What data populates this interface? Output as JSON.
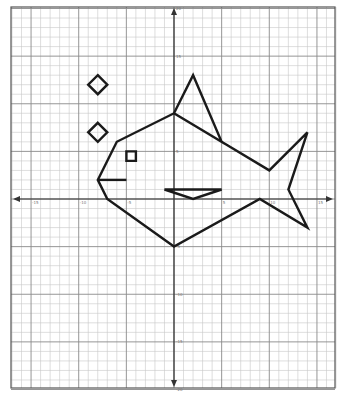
{
  "figure": {
    "type": "coordinate-grid-drawing",
    "colors": {
      "background": "#ffffff",
      "grid_minor": "#c8c8c8",
      "grid_major": "#8a8a8a",
      "axis": "#333333",
      "shape_stroke": "#1a1a1a",
      "border": "#555555"
    }
  },
  "grid": {
    "x_range": [
      -17,
      17
    ],
    "y_range": [
      -20,
      20
    ],
    "step": 1,
    "major_every": 5,
    "origin_px": [
      174,
      199
    ],
    "cell_px_x": 9.53,
    "cell_px_y": 9.53,
    "frame_px": {
      "left": 11,
      "top": 7,
      "right": 335,
      "bottom": 388
    }
  },
  "axes": {
    "x_tick_labels": [
      {
        "value": -15,
        "text": "-15"
      },
      {
        "value": -10,
        "text": "-10"
      },
      {
        "value": -5,
        "text": "-5"
      },
      {
        "value": 5,
        "text": "5"
      },
      {
        "value": 10,
        "text": "10"
      },
      {
        "value": 15,
        "text": "15"
      }
    ],
    "y_tick_labels": [
      {
        "value": 20,
        "text": "20"
      },
      {
        "value": 15,
        "text": "15"
      },
      {
        "value": 5,
        "text": "5"
      },
      {
        "value": -5,
        "text": "-5"
      },
      {
        "value": -10,
        "text": "-10"
      },
      {
        "value": -15,
        "text": "-15"
      },
      {
        "value": -20,
        "text": "-20"
      }
    ]
  },
  "chart_data": {
    "type": "line",
    "title": "",
    "xlabel": "",
    "ylabel": "",
    "xlim": [
      -17,
      17
    ],
    "ylim": [
      -20,
      20
    ],
    "grid": true,
    "series": [
      {
        "name": "fish-body-outline",
        "closed": true,
        "points": [
          [
            0,
            9
          ],
          [
            2,
            13
          ],
          [
            5,
            6
          ],
          [
            0,
            9
          ],
          [
            -6,
            6
          ],
          [
            -8,
            2
          ],
          [
            -7,
            0
          ],
          [
            0,
            -5
          ],
          [
            9,
            0
          ],
          [
            14,
            -3
          ],
          [
            12,
            1
          ],
          [
            14,
            7
          ],
          [
            10,
            3
          ],
          [
            5,
            6
          ]
        ]
      },
      {
        "name": "mouth",
        "closed": false,
        "points": [
          [
            -8,
            2
          ],
          [
            -5,
            2
          ]
        ]
      },
      {
        "name": "eye",
        "closed": true,
        "points": [
          [
            -5,
            5
          ],
          [
            -4,
            5
          ],
          [
            -4,
            4
          ],
          [
            -5,
            4
          ]
        ]
      },
      {
        "name": "side-fin",
        "closed": true,
        "points": [
          [
            -1,
            1
          ],
          [
            5,
            1
          ],
          [
            2,
            0
          ]
        ]
      },
      {
        "name": "bubble-upper",
        "closed": true,
        "points": [
          [
            -8,
            13
          ],
          [
            -7,
            12
          ],
          [
            -8,
            11
          ],
          [
            -9,
            12
          ]
        ]
      },
      {
        "name": "bubble-lower",
        "closed": true,
        "points": [
          [
            -8,
            8
          ],
          [
            -7,
            7
          ],
          [
            -8,
            6
          ],
          [
            -9,
            7
          ]
        ]
      }
    ]
  }
}
